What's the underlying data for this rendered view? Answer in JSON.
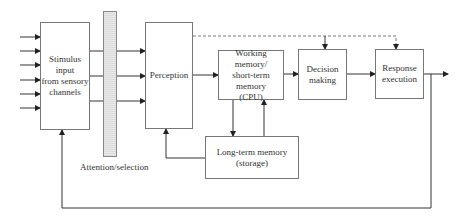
{
  "diagram": {
    "type": "flowchart",
    "title": "",
    "nodes": {
      "stimulus": "Stimulus input from sensory channels",
      "stimulus_lines": [
        "Stimulus",
        "input",
        "from sensory",
        "channels"
      ],
      "perception": "Perception",
      "working_memory_lines": [
        "Working memory/",
        "short-term",
        "memory",
        "(CPU)"
      ],
      "decision_lines": [
        "Decision",
        "making"
      ],
      "response_lines": [
        "Response",
        "execution"
      ],
      "ltm_lines": [
        "Long-term memory",
        "(storage)"
      ]
    },
    "attention_label": "Attention/selection",
    "edges": [
      {
        "from": "sensory channels (6 inputs)",
        "to": "stimulus",
        "style": "solid"
      },
      {
        "from": "stimulus",
        "to": "perception",
        "count": 3,
        "through": "attention/selection",
        "style": "solid"
      },
      {
        "from": "perception",
        "to": "working_memory",
        "style": "solid"
      },
      {
        "from": "working_memory",
        "to": "decision",
        "style": "solid"
      },
      {
        "from": "decision",
        "to": "response",
        "style": "solid"
      },
      {
        "from": "response",
        "to": "output",
        "style": "solid"
      },
      {
        "from": "working_memory",
        "to": "ltm",
        "style": "solid"
      },
      {
        "from": "ltm",
        "to": "working_memory",
        "style": "solid"
      },
      {
        "from": "ltm",
        "to": "perception",
        "style": "solid"
      },
      {
        "from": "perception",
        "to": "decision",
        "style": "dashed"
      },
      {
        "from": "perception",
        "to": "response",
        "style": "dashed"
      },
      {
        "from": "response",
        "to": "stimulus",
        "style": "solid",
        "note": "feedback loop"
      }
    ]
  }
}
